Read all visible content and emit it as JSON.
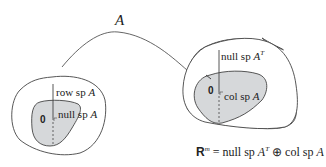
{
  "diagram": {
    "map_label": "A",
    "domain_space": {
      "outer_label": "row sp",
      "outer_label_var": "A",
      "inner_label": "null sp",
      "inner_label_var": "A",
      "origin": "0"
    },
    "codomain_space": {
      "outer_label": "null sp",
      "outer_label_var": "A",
      "outer_label_sup": "T",
      "inner_label": "col sp",
      "inner_label_var": "A",
      "origin": "0"
    },
    "equation": {
      "lhs": "R",
      "lhs_sup": "m",
      "eq": "=",
      "term1": "null sp",
      "term1_var": "A",
      "term1_sup": "T",
      "op": "⊕",
      "term2": "col sp",
      "term2_var": "A"
    },
    "colors": {
      "stroke": "#444444",
      "shaded_region": "#d6d8da",
      "background": "#ffffff"
    }
  }
}
